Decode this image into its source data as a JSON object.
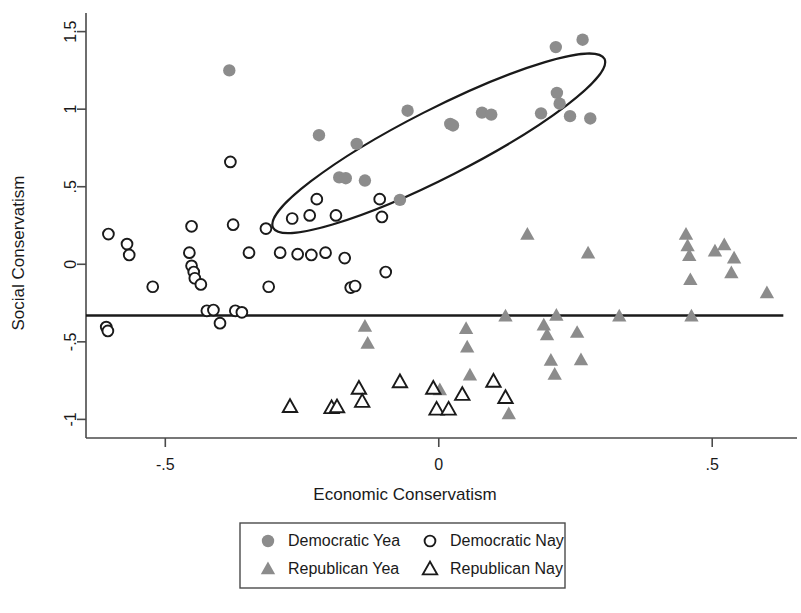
{
  "chart_data": {
    "type": "scatter",
    "title": "",
    "xlabel": "Economic Conservatism",
    "ylabel": "Social Conservatism",
    "xlim": [
      -0.645,
      0.655
    ],
    "ylim": [
      -1.12,
      1.62
    ],
    "xticks": [
      -0.5,
      0,
      0.5
    ],
    "xticklabels": [
      "-.5",
      "0",
      ".5"
    ],
    "yticks": [
      -1,
      -0.5,
      0,
      0.5,
      1,
      1.5
    ],
    "yticklabels": [
      "-1",
      "-.5",
      "0",
      ".5",
      "1",
      "1.5"
    ],
    "grid": false,
    "legend_position": "below-center",
    "annotations": [
      {
        "kind": "horizontal-reference-line",
        "name": "cutpoint-line",
        "y": -0.33,
        "x_start": -0.645,
        "x_end": 0.63,
        "color": "#1a1a1a"
      },
      {
        "kind": "ellipse",
        "name": "democratic-yea-cluster-ellipse",
        "center_x": 0.0,
        "center_y": 0.78,
        "semi_major": 0.34,
        "semi_minor": 0.22,
        "rotation_deg": -27,
        "color": "#1a1a1a"
      }
    ],
    "series": [
      {
        "name": "Democratic Yea",
        "marker": "filled-circle",
        "color": "#8c8c8c",
        "points": [
          [
            -0.383,
            1.25
          ],
          [
            -0.219,
            0.832
          ],
          [
            -0.15,
            0.776
          ],
          [
            -0.182,
            0.56
          ],
          [
            -0.17,
            0.555
          ],
          [
            -0.135,
            0.54
          ],
          [
            -0.071,
            0.415
          ],
          [
            -0.057,
            0.99
          ],
          [
            0.021,
            0.905
          ],
          [
            0.026,
            0.895
          ],
          [
            0.079,
            0.978
          ],
          [
            0.096,
            0.965
          ],
          [
            0.187,
            0.973
          ],
          [
            0.214,
            1.4
          ],
          [
            0.216,
            1.105
          ],
          [
            0.221,
            1.035
          ],
          [
            0.24,
            0.955
          ],
          [
            0.263,
            1.448
          ],
          [
            0.277,
            0.94
          ]
        ]
      },
      {
        "name": "Democratic Nay",
        "marker": "open-circle",
        "color": "#1a1a1a",
        "points": [
          [
            -0.604,
            0.195
          ],
          [
            -0.57,
            0.13
          ],
          [
            -0.566,
            0.06
          ],
          [
            -0.608,
            -0.405
          ],
          [
            -0.605,
            -0.43
          ],
          [
            -0.523,
            -0.145
          ],
          [
            -0.452,
            0.245
          ],
          [
            -0.456,
            0.075
          ],
          [
            -0.452,
            -0.01
          ],
          [
            -0.448,
            -0.05
          ],
          [
            -0.446,
            -0.09
          ],
          [
            -0.435,
            -0.13
          ],
          [
            -0.424,
            -0.3
          ],
          [
            -0.412,
            -0.295
          ],
          [
            -0.4,
            -0.38
          ],
          [
            -0.381,
            0.66
          ],
          [
            -0.376,
            0.255
          ],
          [
            -0.372,
            -0.3
          ],
          [
            -0.36,
            -0.31
          ],
          [
            -0.347,
            0.075
          ],
          [
            -0.316,
            0.23
          ],
          [
            -0.311,
            -0.145
          ],
          [
            -0.29,
            0.075
          ],
          [
            -0.268,
            0.295
          ],
          [
            -0.258,
            0.065
          ],
          [
            -0.236,
            0.315
          ],
          [
            -0.233,
            0.06
          ],
          [
            -0.223,
            0.42
          ],
          [
            -0.207,
            0.075
          ],
          [
            -0.188,
            0.315
          ],
          [
            -0.172,
            0.04
          ],
          [
            -0.161,
            -0.15
          ],
          [
            -0.153,
            -0.14
          ],
          [
            -0.108,
            0.42
          ],
          [
            -0.104,
            0.305
          ],
          [
            -0.097,
            -0.05
          ]
        ]
      },
      {
        "name": "Republican Yea",
        "marker": "filled-triangle",
        "color": "#8c8c8c",
        "points": [
          [
            -0.272,
            -0.915
          ],
          [
            -0.135,
            -0.4
          ],
          [
            -0.13,
            -0.51
          ],
          [
            0.002,
            -0.81
          ],
          [
            0.05,
            -0.415
          ],
          [
            0.052,
            -0.535
          ],
          [
            0.057,
            -0.715
          ],
          [
            0.122,
            -0.335
          ],
          [
            0.128,
            -0.965
          ],
          [
            0.162,
            0.192
          ],
          [
            0.192,
            -0.392
          ],
          [
            0.198,
            -0.455
          ],
          [
            0.205,
            -0.62
          ],
          [
            0.212,
            -0.71
          ],
          [
            0.215,
            -0.33
          ],
          [
            0.253,
            -0.44
          ],
          [
            0.26,
            -0.616
          ],
          [
            0.273,
            0.072
          ],
          [
            0.33,
            -0.335
          ],
          [
            0.452,
            0.193
          ],
          [
            0.455,
            0.118
          ],
          [
            0.458,
            0.055
          ],
          [
            0.46,
            -0.1
          ],
          [
            0.462,
            -0.335
          ],
          [
            0.505,
            0.085
          ],
          [
            0.522,
            0.125
          ],
          [
            0.535,
            -0.055
          ],
          [
            0.54,
            0.04
          ],
          [
            0.6,
            -0.185
          ]
        ]
      },
      {
        "name": "Republican Nay",
        "marker": "open-triangle",
        "color": "#1a1a1a",
        "points": [
          [
            -0.272,
            -0.918
          ],
          [
            -0.196,
            -0.925
          ],
          [
            -0.186,
            -0.92
          ],
          [
            -0.146,
            -0.8
          ],
          [
            -0.14,
            -0.885
          ],
          [
            -0.071,
            -0.758
          ],
          [
            -0.01,
            -0.8
          ],
          [
            -0.004,
            -0.935
          ],
          [
            0.018,
            -0.935
          ],
          [
            0.043,
            -0.84
          ],
          [
            0.1,
            -0.755
          ],
          [
            0.122,
            -0.86
          ]
        ]
      }
    ]
  },
  "legend": {
    "entries": [
      {
        "label": "Democratic Yea",
        "marker": "filled-circle",
        "color": "#8c8c8c"
      },
      {
        "label": "Democratic Nay",
        "marker": "open-circle",
        "color": "#1a1a1a"
      },
      {
        "label": "Republican Yea",
        "marker": "filled-triangle",
        "color": "#8c8c8c"
      },
      {
        "label": "Republican Nay",
        "marker": "open-triangle",
        "color": "#1a1a1a"
      }
    ]
  },
  "colors": {
    "gray_marker": "#8c8c8c",
    "axis": "#4a4a4a",
    "text": "#1a1a1a",
    "reference_line": "#1a1a1a"
  }
}
